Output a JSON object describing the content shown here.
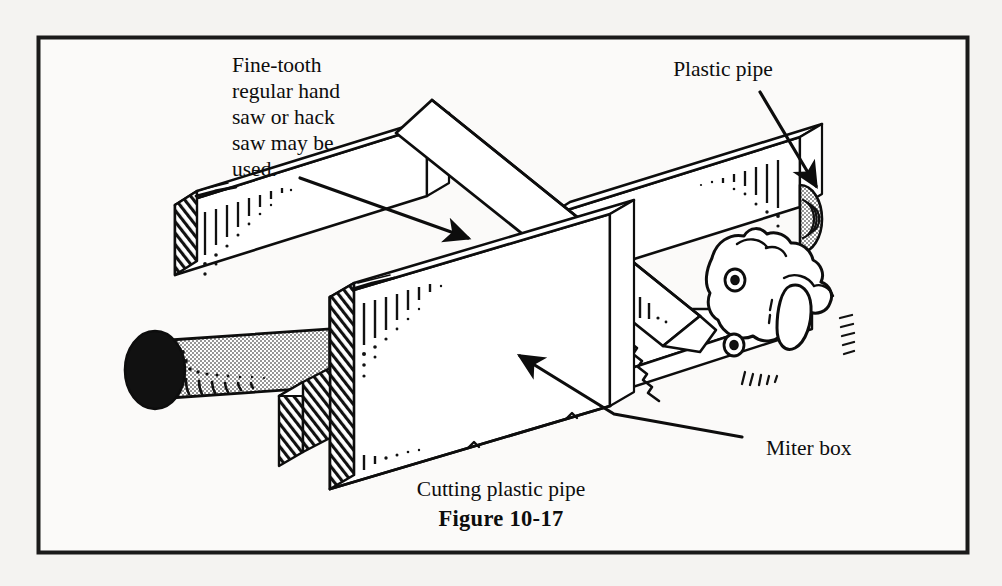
{
  "figure": {
    "caption": "Cutting plastic pipe",
    "number": "Figure 10-17",
    "border_color": "#1a1a1a",
    "ink_color": "#0d0d0d",
    "paper_color": "#f4f3f1",
    "pipe_fill": "#d9d9d9",
    "pipe_end_fill": "#111111"
  },
  "labels": {
    "saw": {
      "lines": [
        "Fine-tooth",
        "regular hand",
        "saw or hack",
        "saw may be",
        "used."
      ],
      "x": 232,
      "y": 72
    },
    "pipe": {
      "text": "Plastic pipe",
      "x": 723,
      "y": 76
    },
    "miter_box": {
      "text": "Miter box",
      "x": 766,
      "y": 455
    },
    "caption": {
      "text": "Cutting plastic pipe",
      "x": 501,
      "y": 496
    },
    "figure_number": {
      "text": "Figure 10-17",
      "x": 501,
      "y": 526
    }
  },
  "parts": [
    {
      "name": "miter-box-back-wall",
      "label": "Miter box back wall"
    },
    {
      "name": "miter-box-front-wall",
      "label": "Miter box front wall"
    },
    {
      "name": "miter-box-base",
      "label": "Miter box base"
    },
    {
      "name": "plastic-pipe",
      "label": "Plastic pipe"
    },
    {
      "name": "hand-saw-blade",
      "label": "Hand saw blade"
    },
    {
      "name": "hand-saw-handle",
      "label": "Hand saw handle"
    },
    {
      "name": "saw-teeth",
      "label": "Saw teeth"
    }
  ]
}
